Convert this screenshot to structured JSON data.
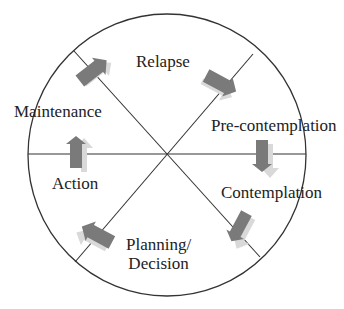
{
  "diagram": {
    "type": "cycle",
    "title": "",
    "colors": {
      "outline": "#333333",
      "arrow_fill": "#7a7a7a",
      "arrow_shadow": "#d9d9d9",
      "text": "#222222",
      "background": "#ffffff"
    },
    "stages": [
      {
        "id": "relapse",
        "label": "Relapse"
      },
      {
        "id": "pre-contemplation",
        "label": "Pre-contemplation"
      },
      {
        "id": "contemplation",
        "label": "Contemplation"
      },
      {
        "id": "planning-decision",
        "label_line1": "Planning/",
        "label_line2": "Decision"
      },
      {
        "id": "action",
        "label": "Action"
      },
      {
        "id": "maintenance",
        "label": "Maintenance"
      }
    ],
    "arrows": [
      {
        "from": "maintenance",
        "to": "relapse",
        "direction": "up-right"
      },
      {
        "from": "relapse",
        "to": "pre-contemplation",
        "direction": "down-right"
      },
      {
        "from": "pre-contemplation",
        "to": "contemplation",
        "direction": "down"
      },
      {
        "from": "contemplation",
        "to": "planning-decision",
        "direction": "down-left"
      },
      {
        "from": "planning-decision",
        "to": "action",
        "direction": "up-left"
      },
      {
        "from": "action",
        "to": "maintenance",
        "direction": "up"
      }
    ]
  }
}
